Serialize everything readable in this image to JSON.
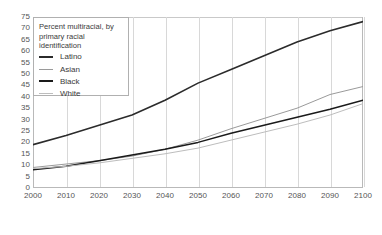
{
  "chart_data": {
    "type": "line",
    "title": "Percent multiracial, by primary racial identification",
    "xlabel": "",
    "ylabel": "",
    "xlim": [
      2000,
      2100
    ],
    "ylim": [
      0,
      75
    ],
    "grid": "vertical",
    "legend_position": "top-left",
    "x": [
      2000,
      2010,
      2020,
      2030,
      2040,
      2050,
      2060,
      2070,
      2080,
      2090,
      2100
    ],
    "xtick_labels": [
      "2000",
      "2010",
      "2020",
      "2030",
      "2040",
      "2050",
      "2060",
      "2070",
      "2080",
      "2090",
      "2100"
    ],
    "ytick_labels": [
      "0",
      "5",
      "10",
      "15",
      "20",
      "25",
      "30",
      "35",
      "40",
      "45",
      "50",
      "55",
      "60",
      "65",
      "70",
      "75"
    ],
    "ytick_values": [
      0,
      5,
      10,
      15,
      20,
      25,
      30,
      35,
      40,
      45,
      50,
      55,
      60,
      65,
      70,
      75
    ],
    "series": [
      {
        "name": "Latino",
        "color": "#2b2b2b",
        "width": 1.6,
        "values": [
          19,
          23,
          27.5,
          32,
          38.5,
          46,
          52,
          58,
          64,
          69,
          73
        ]
      },
      {
        "name": "Asian",
        "color": "#9a9a9a",
        "width": 1.0,
        "values": [
          9,
          10.5,
          12,
          14,
          17,
          21,
          26,
          30.5,
          35,
          41,
          44.5
        ]
      },
      {
        "name": "Black",
        "color": "#1a1a1a",
        "width": 1.5,
        "values": [
          8,
          9.5,
          12,
          14.5,
          17,
          20,
          24,
          27.5,
          31,
          34.5,
          38.5
        ]
      },
      {
        "name": "White",
        "color": "#bdbdbd",
        "width": 1.0,
        "values": [
          8.5,
          9.5,
          11,
          13,
          15,
          17.5,
          21,
          24.5,
          28,
          32,
          37
        ]
      }
    ]
  },
  "legend": {
    "title": "Percent multiracial, by primary racial identification",
    "items": [
      {
        "label": "Latino"
      },
      {
        "label": "Asian"
      },
      {
        "label": "Black"
      },
      {
        "label": "White"
      }
    ]
  }
}
